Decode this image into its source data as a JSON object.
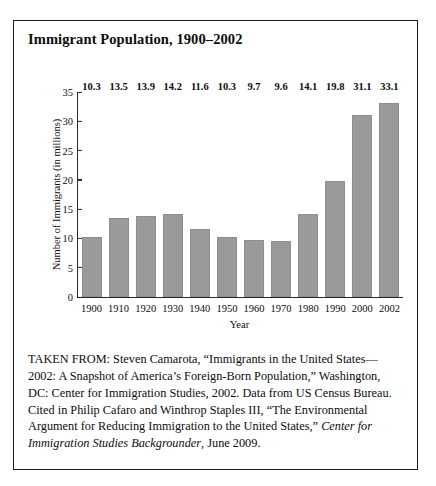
{
  "figure": {
    "title": "Immigrant Population, 1900–2002",
    "caption_parts": {
      "before_italic": "TAKEN FROM: Steven Camarota, “Immigrants in the United States—2002: A Snapshot of America’s Foreign-Born Population,” Washington, DC: Center for Immigration Studies, 2002. Data from US Census Bureau. Cited in Philip Cafaro and Winthrop Staples III, “The Environmental Argument for Reducing Immigration to the United States,” ",
      "italic": "Center for Immigration Studies Backgrounder",
      "after_italic": ", June 2009."
    }
  },
  "colors": {
    "bar_fill": "#9a9a9a",
    "axis": "#2a2a2a",
    "border": "#1b1b1b",
    "text": "#0d0d0d",
    "background": "#ffffff"
  },
  "chart_data": {
    "type": "bar",
    "title": "Immigrant Population, 1900–2002",
    "xlabel": "Year",
    "ylabel": "Number of Immigrants (in millions)",
    "categories": [
      "1900",
      "1910",
      "1920",
      "1930",
      "1940",
      "1950",
      "1960",
      "1970",
      "1980",
      "1990",
      "2000",
      "2002"
    ],
    "values": [
      10.3,
      13.5,
      13.9,
      14.2,
      11.6,
      10.3,
      9.7,
      9.6,
      14.1,
      19.8,
      31.1,
      33.1
    ],
    "value_labels": [
      "10.3",
      "13.5",
      "13.9",
      "14.2",
      "11.6",
      "10.3",
      "9.7",
      "9.6",
      "14.1",
      "19.8",
      "31.1",
      "33.1"
    ],
    "ylim": [
      0,
      35
    ],
    "yticks": [
      0,
      5,
      10,
      15,
      20,
      25,
      30,
      35
    ],
    "ytick_labels": [
      "0",
      "5",
      "10",
      "15",
      "20",
      "25",
      "30",
      "35"
    ],
    "grid": false,
    "legend": null,
    "data_labels_shown": true
  }
}
